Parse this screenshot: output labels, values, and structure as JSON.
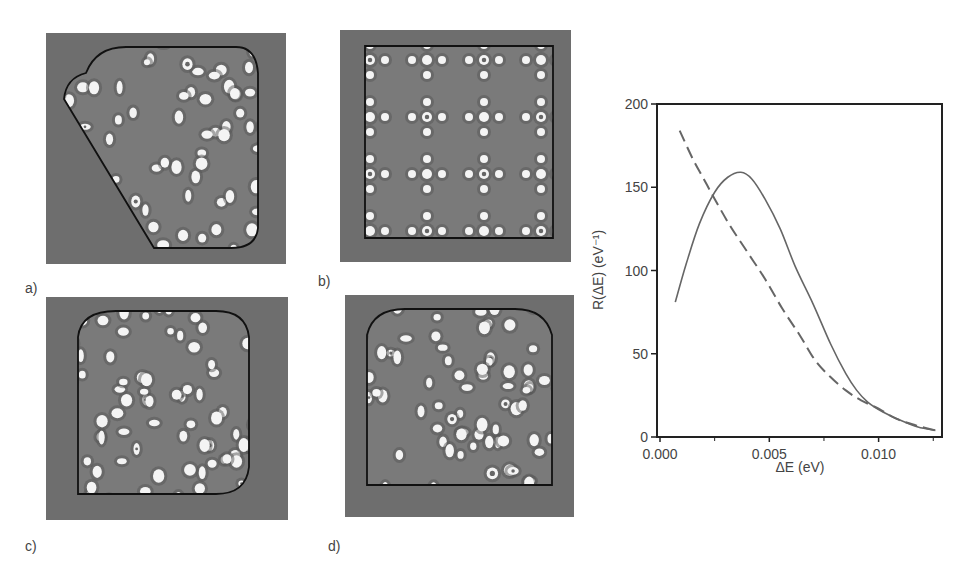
{
  "figure": {
    "panels": [
      {
        "id": "a",
        "label": "a)",
        "shape": "truncated-trapezoid-rounded"
      },
      {
        "id": "b",
        "label": "b)",
        "shape": "square"
      },
      {
        "id": "c",
        "label": "c)",
        "shape": "rounded-square"
      },
      {
        "id": "d",
        "label": "d)",
        "shape": "rounded-top-square"
      }
    ],
    "colors": {
      "panel_background": "#6e6e6e",
      "panel_interior": "#7a7a7a",
      "spot": "#f4f4f4",
      "boundary": "#111111",
      "curve": "#666666"
    }
  },
  "chart_data": {
    "type": "line",
    "title": "",
    "xlabel": "ΔE (eV)",
    "ylabel": "R(ΔE) (eV⁻¹)",
    "xlim": [
      0.0,
      0.0129
    ],
    "ylim": [
      0,
      200
    ],
    "xticks": [
      0.0,
      0.005,
      0.01
    ],
    "xtick_labels": [
      "0.000",
      "0.005",
      "0.010"
    ],
    "x_minor_ticks": [
      0.0025,
      0.0075,
      0.0125
    ],
    "yticks": [
      0,
      50,
      100,
      150,
      200
    ],
    "ytick_labels": [
      "0",
      "50",
      "100",
      "150",
      "200"
    ],
    "grid": false,
    "legend": "none",
    "series": [
      {
        "name": "solid",
        "style": "solid",
        "x": [
          0.0007,
          0.0012,
          0.0018,
          0.0025,
          0.0031,
          0.0037,
          0.0042,
          0.0048,
          0.0055,
          0.0062,
          0.007,
          0.0078,
          0.0085,
          0.009,
          0.0095,
          0.0102,
          0.011,
          0.0118,
          0.0126
        ],
        "y": [
          81,
          104,
          128,
          147,
          156,
          159,
          155,
          143,
          125,
          102,
          80,
          56,
          38,
          28,
          21,
          15,
          10,
          6,
          4
        ]
      },
      {
        "name": "dashed",
        "style": "dashed",
        "x": [
          0.0009,
          0.0015,
          0.002,
          0.0025,
          0.0032,
          0.004,
          0.0048,
          0.0056,
          0.0064,
          0.0071,
          0.0078,
          0.0085,
          0.0092,
          0.01,
          0.0108,
          0.0117,
          0.0126
        ],
        "y": [
          184,
          167,
          155,
          143,
          127,
          111,
          95,
          77,
          61,
          46,
          36,
          28,
          22,
          17,
          11,
          7,
          4
        ]
      }
    ]
  }
}
